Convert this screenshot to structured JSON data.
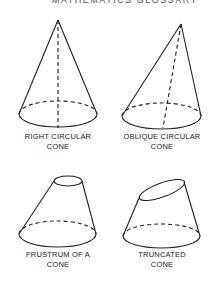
{
  "header": {
    "title": "MATHEMATICS GLOSSARY"
  },
  "figures": [
    {
      "id": "right-circular-cone",
      "caption_line1": "RIGHT CIRCULAR",
      "caption_line2": "CONE"
    },
    {
      "id": "oblique-circular-cone",
      "caption_line1": "OBLIQUE CIRCULAR",
      "caption_line2": "CONE"
    },
    {
      "id": "frustrum-of-a-cone",
      "caption_line1": "FRUSTRUM OF A",
      "caption_line2": "CONE"
    },
    {
      "id": "truncated-cone",
      "caption_line1": "TRUNCATED",
      "caption_line2": "CONE"
    }
  ]
}
